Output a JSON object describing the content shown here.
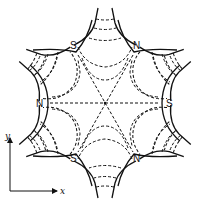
{
  "diagram": {
    "pole_labels": [
      {
        "id": "top-left",
        "text": "S"
      },
      {
        "id": "top-right",
        "text": "N"
      },
      {
        "id": "left",
        "text": "N"
      },
      {
        "id": "right",
        "text": "S"
      },
      {
        "id": "bottom-left",
        "text": "S"
      },
      {
        "id": "bottom-right",
        "text": "N"
      }
    ],
    "axes": {
      "x_label": "x",
      "y_label": "y"
    },
    "colors": {
      "line": "#111111",
      "background": "#ffffff"
    }
  }
}
